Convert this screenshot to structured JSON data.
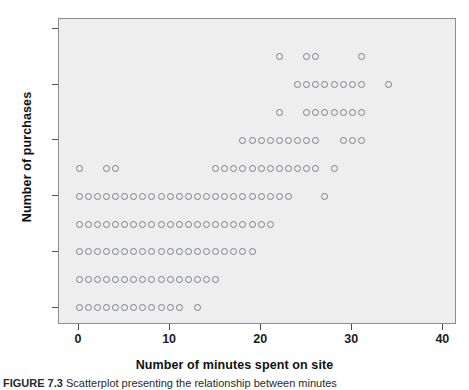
{
  "figure": {
    "type": "scatter-plot",
    "background_color": "#ffffff",
    "plot_background_color": "#eeeeee",
    "point_color": "#7a7f86"
  },
  "axis_x": {
    "label": "Number of minutes spent on site",
    "ticks": [
      0,
      10,
      20,
      30,
      40
    ],
    "min": -2.2,
    "max": 41.5
  },
  "axis_y": {
    "label": "Number of purchases",
    "ticks": [
      0,
      2,
      4,
      6,
      8,
      10
    ],
    "min": -0.62,
    "max": 10.35
  },
  "caption": {
    "number": "FIGURE 7.3",
    "text": "Scatterplot presenting the relationship between minutes"
  },
  "chart_data": {
    "type": "scatter",
    "title": "",
    "xlabel": "Number of minutes spent on site",
    "ylabel": "Number of purchases",
    "xlim": [
      -2.2,
      41.5
    ],
    "ylim": [
      -0.62,
      10.35
    ],
    "xticks": [
      0,
      10,
      20,
      30,
      40
    ],
    "yticks": [
      0,
      2,
      4,
      6,
      8,
      10
    ],
    "grid": false,
    "legend": null,
    "marker": "open-circle",
    "series": [
      {
        "name": "observations",
        "points": [
          [
            0,
            0
          ],
          [
            1,
            0
          ],
          [
            2,
            0
          ],
          [
            3,
            0
          ],
          [
            4,
            0
          ],
          [
            5,
            0
          ],
          [
            6,
            0
          ],
          [
            7,
            0
          ],
          [
            8,
            0
          ],
          [
            9,
            0
          ],
          [
            10,
            0
          ],
          [
            11,
            0
          ],
          [
            13,
            0
          ],
          [
            0,
            1
          ],
          [
            1,
            1
          ],
          [
            2,
            1
          ],
          [
            3,
            1
          ],
          [
            4,
            1
          ],
          [
            5,
            1
          ],
          [
            6,
            1
          ],
          [
            7,
            1
          ],
          [
            8,
            1
          ],
          [
            9,
            1
          ],
          [
            10,
            1
          ],
          [
            11,
            1
          ],
          [
            12,
            1
          ],
          [
            13,
            1
          ],
          [
            14,
            1
          ],
          [
            15,
            1
          ],
          [
            0,
            2
          ],
          [
            1,
            2
          ],
          [
            2,
            2
          ],
          [
            3,
            2
          ],
          [
            4,
            2
          ],
          [
            5,
            2
          ],
          [
            6,
            2
          ],
          [
            7,
            2
          ],
          [
            8,
            2
          ],
          [
            9,
            2
          ],
          [
            10,
            2
          ],
          [
            11,
            2
          ],
          [
            12,
            2
          ],
          [
            13,
            2
          ],
          [
            14,
            2
          ],
          [
            15,
            2
          ],
          [
            16,
            2
          ],
          [
            17,
            2
          ],
          [
            18,
            2
          ],
          [
            19,
            2
          ],
          [
            0,
            3
          ],
          [
            1,
            3
          ],
          [
            2,
            3
          ],
          [
            3,
            3
          ],
          [
            4,
            3
          ],
          [
            5,
            3
          ],
          [
            6,
            3
          ],
          [
            7,
            3
          ],
          [
            8,
            3
          ],
          [
            9,
            3
          ],
          [
            10,
            3
          ],
          [
            11,
            3
          ],
          [
            12,
            3
          ],
          [
            13,
            3
          ],
          [
            14,
            3
          ],
          [
            15,
            3
          ],
          [
            16,
            3
          ],
          [
            17,
            3
          ],
          [
            18,
            3
          ],
          [
            19,
            3
          ],
          [
            20,
            3
          ],
          [
            21,
            3
          ],
          [
            0,
            4
          ],
          [
            1,
            4
          ],
          [
            2,
            4
          ],
          [
            3,
            4
          ],
          [
            4,
            4
          ],
          [
            5,
            4
          ],
          [
            6,
            4
          ],
          [
            7,
            4
          ],
          [
            8,
            4
          ],
          [
            9,
            4
          ],
          [
            10,
            4
          ],
          [
            11,
            4
          ],
          [
            12,
            4
          ],
          [
            13,
            4
          ],
          [
            14,
            4
          ],
          [
            15,
            4
          ],
          [
            16,
            4
          ],
          [
            17,
            4
          ],
          [
            18,
            4
          ],
          [
            19,
            4
          ],
          [
            20,
            4
          ],
          [
            21,
            4
          ],
          [
            22,
            4
          ],
          [
            23,
            4
          ],
          [
            27,
            4
          ],
          [
            0,
            5
          ],
          [
            3,
            5
          ],
          [
            4,
            5
          ],
          [
            15,
            5
          ],
          [
            16,
            5
          ],
          [
            17,
            5
          ],
          [
            18,
            5
          ],
          [
            19,
            5
          ],
          [
            20,
            5
          ],
          [
            21,
            5
          ],
          [
            22,
            5
          ],
          [
            23,
            5
          ],
          [
            24,
            5
          ],
          [
            25,
            5
          ],
          [
            26,
            5
          ],
          [
            28,
            5
          ],
          [
            18,
            6
          ],
          [
            19,
            6
          ],
          [
            20,
            6
          ],
          [
            21,
            6
          ],
          [
            22,
            6
          ],
          [
            23,
            6
          ],
          [
            24,
            6
          ],
          [
            25,
            6
          ],
          [
            26,
            6
          ],
          [
            29,
            6
          ],
          [
            30,
            6
          ],
          [
            31,
            6
          ],
          [
            22,
            7
          ],
          [
            25,
            7
          ],
          [
            26,
            7
          ],
          [
            27,
            7
          ],
          [
            28,
            7
          ],
          [
            29,
            7
          ],
          [
            30,
            7
          ],
          [
            31,
            7
          ],
          [
            24,
            8
          ],
          [
            25,
            8
          ],
          [
            26,
            8
          ],
          [
            27,
            8
          ],
          [
            28,
            8
          ],
          [
            29,
            8
          ],
          [
            30,
            8
          ],
          [
            31,
            8
          ],
          [
            34,
            8
          ],
          [
            22,
            9
          ],
          [
            25,
            9
          ],
          [
            26,
            9
          ],
          [
            31,
            9
          ]
        ]
      }
    ]
  }
}
